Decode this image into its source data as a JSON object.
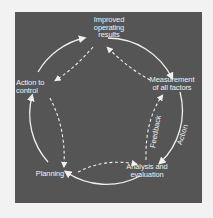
{
  "diagram": {
    "nodes": [
      {
        "id": "improved",
        "label": "Improved\noperating\nresults"
      },
      {
        "id": "measurement",
        "label": "Measurement\nof all factors"
      },
      {
        "id": "analysis",
        "label": "Analysis and\nevaluation"
      },
      {
        "id": "planning",
        "label": "Planning"
      },
      {
        "id": "action",
        "label": "Action to\ncontrol"
      }
    ],
    "cycle_labels": {
      "outer": "Action",
      "inner": "Feedback"
    },
    "outer_cycle_order": [
      "improved",
      "measurement",
      "analysis",
      "planning",
      "action",
      "improved"
    ],
    "inner_cycle_order": [
      "measurement",
      "improved",
      "action",
      "planning",
      "analysis",
      "measurement"
    ],
    "colors": {
      "background": "#555555",
      "page": "#f2f2f2",
      "lines": "#f0f0f0"
    }
  }
}
